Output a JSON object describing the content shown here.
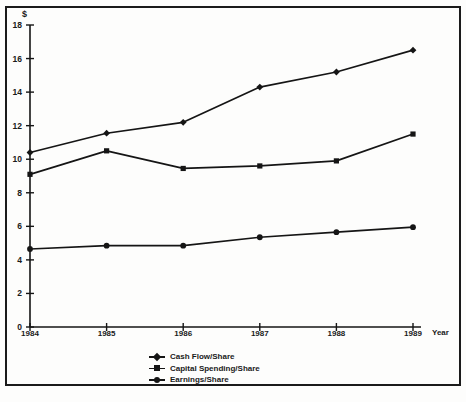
{
  "chart_data": {
    "type": "line",
    "title": "",
    "xlabel": "Year",
    "ylabel": "$",
    "categories": [
      "1984",
      "1985",
      "1986",
      "1987",
      "1988",
      "1989"
    ],
    "x": [
      1984,
      1985,
      1986,
      1987,
      1988,
      1989
    ],
    "xlim": [
      1984,
      1989
    ],
    "ylim": [
      0,
      18
    ],
    "yticks": [
      0,
      2,
      4,
      6,
      8,
      10,
      12,
      14,
      16,
      18
    ],
    "ytick_labels": [
      "0",
      "2",
      "4",
      "6",
      "8",
      "10",
      "12",
      "14",
      "16",
      "18"
    ],
    "xtick_labels": [
      "1984",
      "1985",
      "1986",
      "1987",
      "1988",
      "1989"
    ],
    "grid": false,
    "legend_position": "bottom-center",
    "line_color": "#151515",
    "background_color": "#fdfdfc",
    "series": [
      {
        "name": "Cash Flow/Share",
        "marker": "diamond",
        "values": [
          10.4,
          11.55,
          12.2,
          14.3,
          15.2,
          16.5
        ]
      },
      {
        "name": "Capital Spending/Share",
        "marker": "square",
        "values": [
          9.1,
          10.5,
          9.45,
          9.6,
          9.9,
          11.5
        ]
      },
      {
        "name": "Earnings/Share",
        "marker": "round",
        "values": [
          4.65,
          4.85,
          4.85,
          5.35,
          5.65,
          5.95
        ]
      }
    ]
  },
  "axes": {
    "y_unit_label": "$",
    "x_axis_title": "Year"
  },
  "legend": {
    "items": [
      {
        "label": "Cash Flow/Share",
        "marker": "diamond-marker"
      },
      {
        "label": "Capital Spending/Share",
        "marker": "square-marker"
      },
      {
        "label": "Earnings/Share",
        "marker": "round-marker"
      }
    ]
  }
}
